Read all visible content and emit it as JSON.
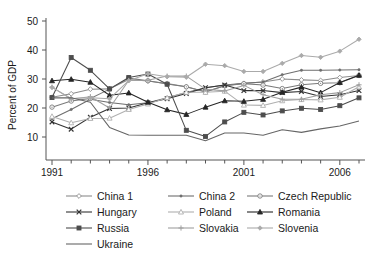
{
  "chart_data": {
    "type": "line",
    "title": "",
    "xlabel": "",
    "ylabel": "Percent of GDP",
    "xlim": [
      1991,
      2007
    ],
    "ylim": [
      6,
      50
    ],
    "grid": false,
    "legend_position": "bottom",
    "x_ticks_major": [
      "1991",
      "1996",
      "2001",
      "2006"
    ],
    "x_ticks_major_values": [
      1991,
      1996,
      2001,
      2006
    ],
    "x_ticks_minor_values": [
      1992,
      1993,
      1994,
      1995,
      1997,
      1998,
      1999,
      2000,
      2002,
      2003,
      2004,
      2005,
      2007
    ],
    "y_ticks": [
      "10",
      "20",
      "30",
      "40",
      "50"
    ],
    "y_ticks_values": [
      10,
      20,
      30,
      40,
      50
    ],
    "x": [
      1991,
      1992,
      1993,
      1994,
      1995,
      1996,
      1997,
      1998,
      1999,
      2000,
      2001,
      2002,
      2003,
      2004,
      2005,
      2006,
      2007
    ],
    "series": [
      {
        "name": "China 1",
        "marker": "open-diamond",
        "color": "#8c8c8c",
        "values": [
          23.7,
          24.9,
          26.5,
          26.6,
          29.8,
          29.3,
          28.4,
          27.3,
          25.6,
          27.7,
          28.5,
          29.0,
          30.0,
          29.7,
          29.5,
          30.5,
          31.2
        ]
      },
      {
        "name": "China 2",
        "marker": "dot",
        "color": "#6e6e6e",
        "values": [
          16.3,
          19.5,
          23.0,
          21.9,
          21.1,
          21.8,
          23.5,
          25.3,
          27.0,
          27.9,
          28.5,
          29.0,
          31.5,
          33.0,
          33.0,
          33.1,
          33.2
        ]
      },
      {
        "name": "Czech Republic",
        "marker": "open-circle",
        "color": "#7a7a7a",
        "values": [
          20.3,
          22.4,
          23.3,
          26.5,
          30.3,
          29.4,
          28.3,
          27.3,
          25.5,
          27.7,
          28.4,
          27.9,
          26.7,
          28.0,
          28.5,
          28.7,
          31.2
        ]
      },
      {
        "name": "Hungary",
        "marker": "x",
        "color": "#333333",
        "values": [
          15.2,
          12.7,
          16.8,
          19.8,
          20.0,
          21.8,
          23.2,
          25.0,
          27.0,
          27.9,
          26.0,
          26.0,
          25.3,
          25.7,
          24.0,
          24.6,
          26.0
        ]
      },
      {
        "name": "Poland",
        "marker": "open-triangle",
        "color": "#b0b0b0",
        "values": [
          17.1,
          14.9,
          16.4,
          16.5,
          19.5,
          21.4,
          23.5,
          25.4,
          25.4,
          25.8,
          21.0,
          20.9,
          22.5,
          22.9,
          22.8,
          23.7,
          27.3
        ]
      },
      {
        "name": "Romania",
        "marker": "filled-triangle",
        "color": "#262626",
        "values": [
          29.4,
          29.9,
          28.9,
          24.4,
          25.2,
          22.0,
          19.4,
          17.8,
          20.3,
          22.5,
          22.3,
          23.0,
          25.4,
          27.2,
          25.3,
          28.8,
          31.3
        ]
      },
      {
        "name": "Russia",
        "marker": "filled-square",
        "color": "#4d4d4d",
        "values": [
          23.6,
          37.4,
          33.0,
          26.6,
          30.5,
          31.7,
          28.2,
          12.3,
          10.2,
          15.2,
          18.5,
          17.6,
          19.0,
          19.9,
          19.5,
          20.8,
          23.5
        ]
      },
      {
        "name": "Slovakia",
        "marker": "plus",
        "color": "#9f9f9f",
        "values": [
          27.2,
          23.1,
          23.9,
          20.0,
          29.5,
          29.6,
          31.0,
          31.0,
          26.5,
          25.9,
          27.8,
          24.6,
          23.0,
          23.0,
          24.6,
          25.3,
          28.0
        ]
      },
      {
        "name": "Slovenia",
        "marker": "small-diamond",
        "color": "#aaaaaa",
        "values": [
          27.1,
          23.3,
          23.5,
          23.2,
          29.4,
          31.8,
          30.8,
          30.6,
          35.1,
          34.6,
          32.6,
          32.6,
          35.4,
          38.1,
          37.5,
          39.6,
          43.7
        ]
      },
      {
        "name": "Ukraine",
        "marker": "none",
        "color": "#666666",
        "values": [
          23.5,
          23.5,
          22.0,
          13.3,
          10.7,
          10.6,
          10.6,
          10.6,
          8.7,
          11.4,
          11.4,
          10.6,
          12.5,
          11.6,
          12.8,
          13.8,
          15.5
        ]
      }
    ]
  },
  "axis": {
    "y_title": "Percent of GDP"
  },
  "legend": {
    "rows": [
      [
        "China 1",
        "China 2",
        "Czech Republic"
      ],
      [
        "Hungary",
        "Poland",
        "Romania"
      ],
      [
        "Russia",
        "Slovakia",
        "Slovenia"
      ],
      [
        "Ukraine"
      ]
    ],
    "entries": [
      {
        "label": "China 1",
        "marker": "open-diamond",
        "color": "#8c8c8c"
      },
      {
        "label": "China 2",
        "marker": "dot",
        "color": "#6e6e6e"
      },
      {
        "label": "Czech Republic",
        "marker": "open-circle",
        "color": "#7a7a7a"
      },
      {
        "label": "Hungary",
        "marker": "x",
        "color": "#333333"
      },
      {
        "label": "Poland",
        "marker": "open-triangle",
        "color": "#b0b0b0"
      },
      {
        "label": "Romania",
        "marker": "filled-triangle",
        "color": "#262626"
      },
      {
        "label": "Russia",
        "marker": "filled-square",
        "color": "#4d4d4d"
      },
      {
        "label": "Slovakia",
        "marker": "plus",
        "color": "#9f9f9f"
      },
      {
        "label": "Slovenia",
        "marker": "small-diamond",
        "color": "#aaaaaa"
      },
      {
        "label": "Ukraine",
        "marker": "none",
        "color": "#666666"
      }
    ]
  }
}
